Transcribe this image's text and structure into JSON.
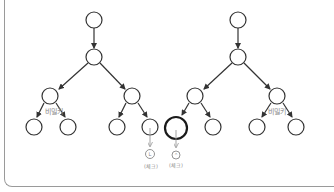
{
  "diagram": {
    "type": "tree-comparison",
    "colors": {
      "stroke": "#333333",
      "annotation": "#888888",
      "frame": "#9a9a9a",
      "background": "#ffffff"
    },
    "left_tree": {
      "edge_label": "비밀키",
      "leaf_annotation": {
        "symbol": "L",
        "label": "(체크)"
      }
    },
    "right_tree": {
      "edge_label": "비밀키",
      "leaf_annotation": {
        "symbol": "⌃",
        "label": "(체크)"
      }
    }
  }
}
